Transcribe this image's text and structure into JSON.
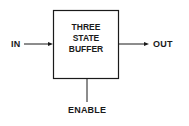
{
  "diagram": {
    "block": {
      "lines": [
        "THREE",
        "STATE",
        "BUFFER"
      ]
    },
    "input_label": "IN",
    "output_label": "OUT",
    "control_label": "ENABLE",
    "colors": {
      "stroke": "#1a1a1a",
      "background": "#ffffff"
    }
  }
}
